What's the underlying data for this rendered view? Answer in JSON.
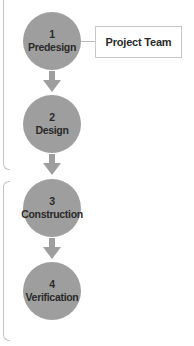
{
  "diagram": {
    "type": "vertical process flow",
    "colors": {
      "node_fill": "#9e9e9e",
      "arrow": "#9e9e9e",
      "text": "#2a2a2a",
      "bracket": "#c4c4c4",
      "callout_border": "#c8c8c8"
    },
    "steps": [
      {
        "number": "1",
        "label": "Predesign"
      },
      {
        "number": "2",
        "label": "Design"
      },
      {
        "number": "3",
        "label": "Construction"
      },
      {
        "number": "4",
        "label": "Verification"
      }
    ],
    "callout": {
      "label": "Project Team",
      "attached_to_step": "1"
    }
  }
}
